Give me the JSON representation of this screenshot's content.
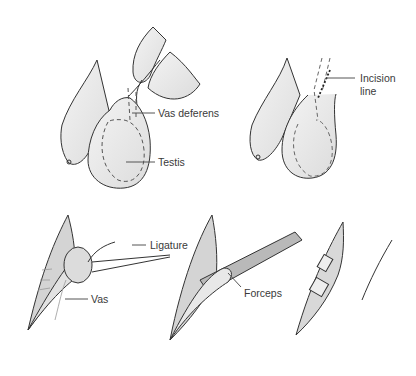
{
  "figure": {
    "panels": [
      {
        "id": "panel-1",
        "description": "Vas deferens isolated between fingers above testis",
        "labels": [
          "Vas deferens",
          "Testis"
        ]
      },
      {
        "id": "panel-2",
        "description": "Scrotum with marked incision line",
        "labels": [
          "Incision line"
        ]
      },
      {
        "id": "panel-3",
        "description": "Vas lifted with ligature",
        "labels": [
          "Ligature",
          "Vas"
        ]
      },
      {
        "id": "panel-4",
        "description": "Forceps under vas",
        "labels": [
          "Forceps"
        ]
      },
      {
        "id": "panel-5",
        "description": "Cut vas ends within incision",
        "labels": []
      }
    ],
    "labels": {
      "vas_deferens": "Vas deferens",
      "testis": "Testis",
      "incision_line_1": "Incision",
      "incision_line_2": "line",
      "ligature": "Ligature",
      "vas": "Vas",
      "forceps": "Forceps"
    },
    "colors": {
      "fill": "#e6e6e6",
      "fill_dark": "#c8c8c8",
      "stroke": "#333333",
      "leader": "#555555"
    }
  }
}
